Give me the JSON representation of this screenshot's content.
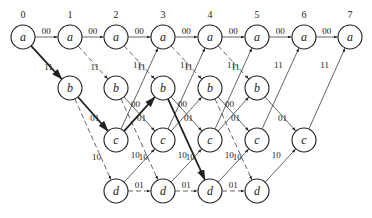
{
  "diagram": {
    "type": "trellis",
    "time_labels": [
      "0",
      "1",
      "2",
      "3",
      "4",
      "5",
      "6",
      "7"
    ],
    "states": [
      "a",
      "b",
      "c",
      "d"
    ],
    "columns_x": [
      23,
      70,
      116,
      163,
      210,
      257,
      304,
      350
    ],
    "rows_y": {
      "a": 37,
      "b": 88,
      "c": 140,
      "d": 191
    },
    "nodes": [
      {
        "t": 0,
        "s": "a"
      },
      {
        "t": 1,
        "s": "a"
      },
      {
        "t": 1,
        "s": "b"
      },
      {
        "t": 2,
        "s": "a"
      },
      {
        "t": 2,
        "s": "b"
      },
      {
        "t": 2,
        "s": "c"
      },
      {
        "t": 2,
        "s": "d"
      },
      {
        "t": 3,
        "s": "a"
      },
      {
        "t": 3,
        "s": "b"
      },
      {
        "t": 3,
        "s": "c"
      },
      {
        "t": 3,
        "s": "d"
      },
      {
        "t": 4,
        "s": "a"
      },
      {
        "t": 4,
        "s": "b"
      },
      {
        "t": 4,
        "s": "c"
      },
      {
        "t": 4,
        "s": "d"
      },
      {
        "t": 5,
        "s": "a"
      },
      {
        "t": 5,
        "s": "b"
      },
      {
        "t": 5,
        "s": "c"
      },
      {
        "t": 5,
        "s": "d"
      },
      {
        "t": 6,
        "s": "a"
      },
      {
        "t": 6,
        "s": "c"
      },
      {
        "t": 7,
        "s": "a"
      }
    ],
    "edges": [
      {
        "from": [
          0,
          "a"
        ],
        "to": [
          1,
          "a"
        ],
        "label": "00",
        "style": "solid"
      },
      {
        "from": [
          0,
          "a"
        ],
        "to": [
          1,
          "b"
        ],
        "label": "11",
        "style": "bold"
      },
      {
        "from": [
          1,
          "a"
        ],
        "to": [
          2,
          "a"
        ],
        "label": "00",
        "style": "solid"
      },
      {
        "from": [
          1,
          "a"
        ],
        "to": [
          2,
          "b"
        ],
        "label": "11",
        "style": "dashed"
      },
      {
        "from": [
          1,
          "b"
        ],
        "to": [
          2,
          "c"
        ],
        "label": "01",
        "style": "bold"
      },
      {
        "from": [
          1,
          "b"
        ],
        "to": [
          2,
          "d"
        ],
        "label": "10",
        "style": "dashed"
      },
      {
        "from": [
          2,
          "a"
        ],
        "to": [
          3,
          "a"
        ],
        "label": "00",
        "style": "solid"
      },
      {
        "from": [
          2,
          "a"
        ],
        "to": [
          3,
          "b"
        ],
        "label": "11",
        "style": "dashed"
      },
      {
        "from": [
          2,
          "b"
        ],
        "to": [
          3,
          "c"
        ],
        "label": "01",
        "style": "solid"
      },
      {
        "from": [
          2,
          "b"
        ],
        "to": [
          3,
          "d"
        ],
        "label": "10",
        "style": "dashed"
      },
      {
        "from": [
          2,
          "c"
        ],
        "to": [
          3,
          "a"
        ],
        "label": "11",
        "style": "solid"
      },
      {
        "from": [
          2,
          "c"
        ],
        "to": [
          3,
          "b"
        ],
        "label": "00",
        "style": "bold"
      },
      {
        "from": [
          2,
          "d"
        ],
        "to": [
          3,
          "c"
        ],
        "label": "10",
        "style": "solid"
      },
      {
        "from": [
          2,
          "d"
        ],
        "to": [
          3,
          "d"
        ],
        "label": "01",
        "style": "dashed"
      },
      {
        "from": [
          3,
          "a"
        ],
        "to": [
          4,
          "a"
        ],
        "label": "00",
        "style": "solid"
      },
      {
        "from": [
          3,
          "a"
        ],
        "to": [
          4,
          "b"
        ],
        "label": "11",
        "style": "dashed"
      },
      {
        "from": [
          3,
          "b"
        ],
        "to": [
          4,
          "c"
        ],
        "label": "01",
        "style": "solid"
      },
      {
        "from": [
          3,
          "b"
        ],
        "to": [
          4,
          "d"
        ],
        "label": "10",
        "style": "bold"
      },
      {
        "from": [
          3,
          "c"
        ],
        "to": [
          4,
          "a"
        ],
        "label": "11",
        "style": "solid"
      },
      {
        "from": [
          3,
          "c"
        ],
        "to": [
          4,
          "b"
        ],
        "label": "00",
        "style": "solid"
      },
      {
        "from": [
          3,
          "d"
        ],
        "to": [
          4,
          "c"
        ],
        "label": "10",
        "style": "solid"
      },
      {
        "from": [
          3,
          "d"
        ],
        "to": [
          4,
          "d"
        ],
        "label": "01",
        "style": "dashed"
      },
      {
        "from": [
          4,
          "a"
        ],
        "to": [
          5,
          "a"
        ],
        "label": "00",
        "style": "solid"
      },
      {
        "from": [
          4,
          "a"
        ],
        "to": [
          5,
          "b"
        ],
        "label": "11",
        "style": "dashed"
      },
      {
        "from": [
          4,
          "b"
        ],
        "to": [
          5,
          "c"
        ],
        "label": "01",
        "style": "solid"
      },
      {
        "from": [
          4,
          "b"
        ],
        "to": [
          5,
          "d"
        ],
        "label": "10",
        "style": "dashed"
      },
      {
        "from": [
          4,
          "c"
        ],
        "to": [
          5,
          "a"
        ],
        "label": "11",
        "style": "solid"
      },
      {
        "from": [
          4,
          "c"
        ],
        "to": [
          5,
          "b"
        ],
        "label": "00",
        "style": "solid"
      },
      {
        "from": [
          4,
          "d"
        ],
        "to": [
          5,
          "c"
        ],
        "label": "10",
        "style": "solid"
      },
      {
        "from": [
          4,
          "d"
        ],
        "to": [
          5,
          "d"
        ],
        "label": "01",
        "style": "dashed"
      },
      {
        "from": [
          5,
          "a"
        ],
        "to": [
          6,
          "a"
        ],
        "label": "00",
        "style": "solid"
      },
      {
        "from": [
          5,
          "b"
        ],
        "to": [
          6,
          "c"
        ],
        "label": "01",
        "style": "solid"
      },
      {
        "from": [
          5,
          "c"
        ],
        "to": [
          6,
          "a"
        ],
        "label": "11",
        "style": "solid"
      },
      {
        "from": [
          5,
          "d"
        ],
        "to": [
          6,
          "c"
        ],
        "label": "10",
        "style": "solid"
      },
      {
        "from": [
          6,
          "a"
        ],
        "to": [
          7,
          "a"
        ],
        "label": "00",
        "style": "solid"
      },
      {
        "from": [
          6,
          "c"
        ],
        "to": [
          7,
          "a"
        ],
        "label": "11",
        "style": "solid"
      }
    ]
  }
}
